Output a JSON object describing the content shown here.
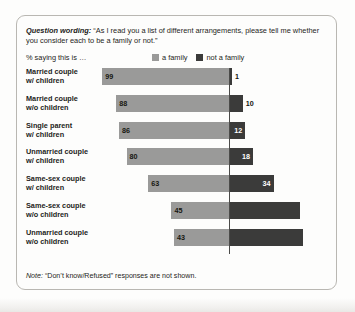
{
  "card": {
    "question_label": "Question wording:",
    "question_text": "“As I read you a list of different arrangements, please tell me whether you consider each to be a family or not.”",
    "saying_label": "% saying this is …",
    "note_label": "Note:",
    "note_text": " “Don’t know/Refused” responses are not shown."
  },
  "legend": {
    "items": [
      {
        "label": "a family",
        "color": "#9a9a99",
        "swatch_name": "legend-swatch-a-family"
      },
      {
        "label": "not a family",
        "color": "#3b3b3a",
        "swatch_name": "legend-swatch-not-a-family"
      }
    ]
  },
  "colors": {
    "a_family": "#9a9a99",
    "not_a_family": "#3b3b3a",
    "axis": "#4b4b49",
    "card_border": "#b9b7b2",
    "text": "#1d1d1b"
  },
  "chart_data": {
    "type": "bar",
    "title": "",
    "subtitle": "% saying this is …",
    "orientation": "horizontal",
    "stacked": "diverging",
    "xlabel": "",
    "ylabel": "",
    "xlim": [
      0,
      100
    ],
    "grid": false,
    "legend_position": "top-right",
    "categories": [
      "Married couple w/ children",
      "Married couple w/o children",
      "Single parent w/ children",
      "Unmarried couple w/ children",
      "Same-sex couple w/ children",
      "Same-sex couple w/o children",
      "Unmarried couple w/o children"
    ],
    "category_lines": [
      [
        "Married couple",
        "w/ children"
      ],
      [
        "Married couple",
        "w/o children"
      ],
      [
        "Single parent",
        "w/ children"
      ],
      [
        "Unmarried couple",
        "w/ children"
      ],
      [
        "Same-sex couple",
        "w/ children"
      ],
      [
        "Same-sex couple",
        "w/o children"
      ],
      [
        "Unmarried couple",
        "w/o children"
      ]
    ],
    "series": [
      {
        "name": "a family",
        "values": [
          99,
          88,
          86,
          80,
          63,
          45,
          43
        ]
      },
      {
        "name": "not a family",
        "values": [
          1,
          10,
          12,
          18,
          34,
          null,
          null
        ]
      }
    ],
    "value_labels": {
      "a family": [
        "99",
        "88",
        "86",
        "80",
        "63",
        "45",
        "43"
      ],
      "not a family": [
        "1",
        "10",
        "12",
        "18",
        "34",
        "",
        ""
      ]
    },
    "annotations": [
      "Note: “Don’t know/Refused” responses are not shown."
    ]
  },
  "layout": {
    "axis_x_px": 212,
    "px_per_unit": 1.28,
    "row_height_px": 17,
    "row_gap_px": 9.8,
    "plot_top_px": 52
  }
}
